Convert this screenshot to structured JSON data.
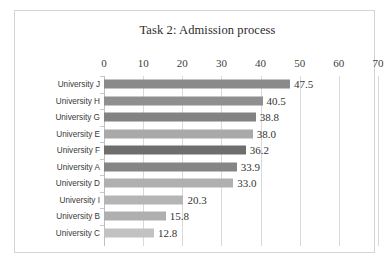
{
  "chart_data": {
    "type": "bar",
    "orientation": "horizontal",
    "title": "Task 2: Admission process",
    "xlabel": "",
    "ylabel": "",
    "xlim": [
      0,
      70
    ],
    "xticks": [
      0,
      10,
      20,
      30,
      40,
      50,
      60,
      70
    ],
    "xtick_labels": [
      "0",
      "10",
      "20",
      "30",
      "40",
      "50",
      "60",
      "70"
    ],
    "grid": true,
    "legend": false,
    "data_labels": true,
    "categories": [
      "University J",
      "University H",
      "University G",
      "University E",
      "University F",
      "University A",
      "University D",
      "University I",
      "University B",
      "University C"
    ],
    "values": [
      47.5,
      40.5,
      38.8,
      38.0,
      36.2,
      33.9,
      33.0,
      20.3,
      15.8,
      12.8
    ],
    "value_labels": [
      "47.5",
      "40.5",
      "38.8",
      "38.0",
      "36.2",
      "33.9",
      "33.0",
      "20.3",
      "15.8",
      "12.8"
    ],
    "bar_colors": [
      "#8a8a8a",
      "#8f8f8f",
      "#828282",
      "#a9a9a9",
      "#6e6e6e",
      "#858585",
      "#b0b0b0",
      "#b5b5b5",
      "#afafaf",
      "#c2c2c2"
    ]
  },
  "style": {
    "canvas_background": "#ffffff",
    "frame_border_color": "#d4d4d4",
    "gridline_color": "#d9d9d9",
    "axis_color": "#bfbfbf",
    "title_color": "#2b2b2b",
    "tick_label_color": "#404040",
    "category_label_color": "#3a3a3a",
    "value_label_color": "#333333"
  }
}
